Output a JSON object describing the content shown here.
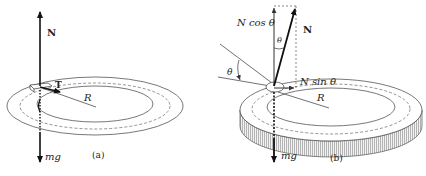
{
  "panel_a": {
    "caption": "(a)",
    "labels": {
      "normal": "N",
      "tension": "T",
      "radius": "R",
      "weight": "mg"
    }
  },
  "panel_b": {
    "caption": "(b)",
    "labels": {
      "normal": "N",
      "n_cos": "N cos θ",
      "n_sin": "N sin θ",
      "theta_top": "θ",
      "theta_left": "θ",
      "radius": "R",
      "weight": "mg"
    }
  },
  "colors": {
    "line": "#222222",
    "ring": "#555555",
    "dashed": "#666666",
    "hatch": "#999999",
    "background": "#ffffff"
  }
}
